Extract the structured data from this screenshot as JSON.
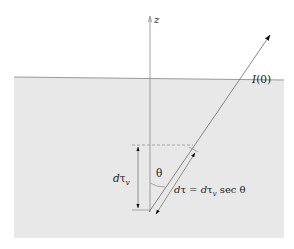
{
  "diagram": {
    "type": "radiative-transfer-slab",
    "colors": {
      "background": "#ffffff",
      "medium": "#e8e8e8",
      "surface_line": "#9a9a9a",
      "lines": "#7a7a7a",
      "arrowheads": "#111111",
      "text": "#222222"
    },
    "labels": {
      "z_axis": "z",
      "intensity": "I(0)",
      "intensity_I": "I",
      "intensity_arg": "(0)",
      "angle": "θ",
      "vertical_depth_d": "dτ",
      "vertical_depth_sub": "v",
      "slant_lhs": "dτ = dτ",
      "slant_sub": "v",
      "slant_rhs": " sec θ"
    }
  }
}
